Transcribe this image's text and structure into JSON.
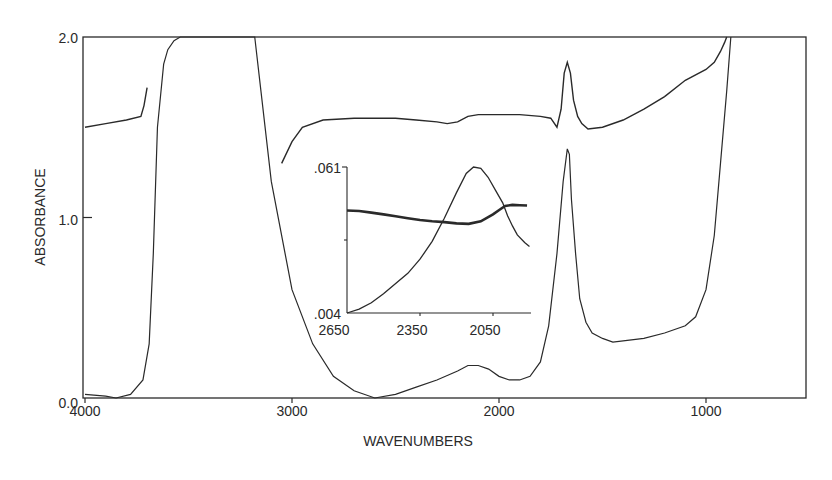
{
  "chart_data": [
    {
      "type": "line",
      "title": "",
      "xlabel": "WAVENUMBERS",
      "ylabel": "ABSORBANCE",
      "xlim": [
        4000,
        500
      ],
      "ylim": [
        0.0,
        2.0
      ],
      "x_ticks": [
        "4000",
        "3000",
        "2000",
        "1000"
      ],
      "x_tick_values": [
        4000,
        3000,
        2000,
        1000
      ],
      "y_ticks": [
        "0.0",
        "1.0",
        "2.0"
      ],
      "y_tick_values": [
        0.0,
        1.0,
        2.0
      ],
      "grid": false,
      "legend": null,
      "series": [
        {
          "name": "lower spectrum",
          "x": [
            4000,
            3900,
            3850,
            3780,
            3720,
            3690,
            3670,
            3650,
            3620,
            3600,
            3570,
            3540,
            3400,
            3180,
            3150,
            3100,
            3000,
            2900,
            2800,
            2700,
            2600,
            2500,
            2400,
            2300,
            2200,
            2150,
            2100,
            2050,
            2000,
            1950,
            1900,
            1850,
            1800,
            1760,
            1720,
            1690,
            1670,
            1660,
            1650,
            1630,
            1610,
            1580,
            1550,
            1500,
            1450,
            1300,
            1200,
            1100,
            1050,
            1000,
            960,
            930,
            900,
            880
          ],
          "y": [
            0.02,
            0.01,
            0.0,
            0.02,
            0.1,
            0.3,
            0.8,
            1.5,
            1.85,
            1.93,
            1.98,
            2.0,
            2.0,
            2.0,
            1.7,
            1.2,
            0.6,
            0.3,
            0.12,
            0.04,
            0.0,
            0.02,
            0.06,
            0.1,
            0.15,
            0.18,
            0.18,
            0.16,
            0.12,
            0.1,
            0.1,
            0.12,
            0.2,
            0.4,
            0.8,
            1.2,
            1.38,
            1.35,
            1.1,
            0.8,
            0.55,
            0.42,
            0.36,
            0.33,
            0.31,
            0.33,
            0.36,
            0.4,
            0.45,
            0.6,
            0.9,
            1.3,
            1.7,
            2.0
          ]
        },
        {
          "name": "upper spectrum",
          "x": [
            4000,
            3900,
            3800,
            3730,
            3715,
            3700,
            3050,
            3000,
            2950,
            2850,
            2700,
            2500,
            2400,
            2300,
            2250,
            2200,
            2150,
            2100,
            2000,
            1900,
            1800,
            1750,
            1720,
            1700,
            1685,
            1670,
            1655,
            1640,
            1620,
            1600,
            1570,
            1500,
            1400,
            1300,
            1200,
            1100,
            1000,
            960,
            930,
            910,
            900
          ],
          "y": [
            1.5,
            1.52,
            1.54,
            1.56,
            1.62,
            1.72,
            1.3,
            1.42,
            1.5,
            1.54,
            1.55,
            1.55,
            1.54,
            1.53,
            1.52,
            1.53,
            1.56,
            1.57,
            1.57,
            1.57,
            1.56,
            1.55,
            1.5,
            1.6,
            1.8,
            1.86,
            1.8,
            1.65,
            1.56,
            1.52,
            1.49,
            1.5,
            1.54,
            1.6,
            1.67,
            1.76,
            1.82,
            1.86,
            1.92,
            1.97,
            2.0
          ]
        }
      ]
    },
    {
      "type": "line",
      "title": "inset",
      "xlabel": "",
      "ylabel": "",
      "xlim": [
        2650,
        1900
      ],
      "ylim": [
        0.004,
        0.061
      ],
      "x_ticks": [
        "2650",
        "2350",
        "2050"
      ],
      "x_tick_values": [
        2650,
        2350,
        2050
      ],
      "y_ticks": [
        ".004",
        ".061"
      ],
      "y_tick_values": [
        0.004,
        0.061
      ],
      "grid": false,
      "series": [
        {
          "name": "thin curve",
          "x": [
            2650,
            2600,
            2550,
            2500,
            2450,
            2400,
            2350,
            2300,
            2250,
            2200,
            2160,
            2130,
            2100,
            2070,
            2040,
            2010,
            1990,
            1970,
            1950,
            1920,
            1900
          ],
          "y": [
            0.004,
            0.0055,
            0.008,
            0.0115,
            0.0155,
            0.0195,
            0.025,
            0.032,
            0.041,
            0.051,
            0.0585,
            0.061,
            0.0605,
            0.057,
            0.052,
            0.047,
            0.042,
            0.038,
            0.0345,
            0.0315,
            0.03
          ]
        },
        {
          "name": "thick curve",
          "x": [
            2650,
            2600,
            2550,
            2500,
            2450,
            2400,
            2350,
            2300,
            2250,
            2200,
            2150,
            2100,
            2050,
            2020,
            2000,
            1970,
            1940,
            1910
          ],
          "y": [
            0.044,
            0.0438,
            0.0432,
            0.0425,
            0.0418,
            0.041,
            0.0403,
            0.0398,
            0.0395,
            0.039,
            0.0388,
            0.0398,
            0.0425,
            0.0445,
            0.0458,
            0.0462,
            0.0461,
            0.046
          ]
        }
      ]
    }
  ],
  "labels": {
    "xlabel": "WAVENUMBERS",
    "ylabel": "ABSORBANCE",
    "main_x_ticks": [
      "4000",
      "3000",
      "2000",
      "1000"
    ],
    "main_y_ticks": [
      "0.0",
      "1.0",
      "2.0"
    ],
    "inset_x_ticks": [
      "2650",
      "2350",
      "2050"
    ],
    "inset_y_top": ".061",
    "inset_y_bottom": ".004"
  },
  "colors": {
    "ink": "#2a2a2a",
    "background": "#ffffff"
  }
}
